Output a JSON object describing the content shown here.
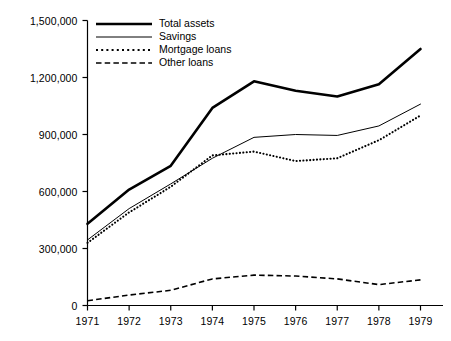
{
  "chart_data": {
    "type": "line",
    "title": "",
    "xlabel": "",
    "ylabel": "",
    "grid": false,
    "legend_position": "top-left-inside",
    "x": [
      1971,
      1972,
      1973,
      1974,
      1975,
      1976,
      1977,
      1978,
      1979
    ],
    "xticklabels": [
      "1971",
      "1972",
      "1973",
      "1974",
      "1975",
      "1976",
      "1977",
      "1978",
      "1979"
    ],
    "xlim": [
      1971,
      1979
    ],
    "ylim": [
      0,
      1500000
    ],
    "yticks": [
      0,
      300000,
      600000,
      900000,
      1200000,
      1500000
    ],
    "yticklabels": [
      "0",
      "300,000",
      "600,000",
      "900,000",
      "1,200,000",
      "1,500,000"
    ],
    "series": [
      {
        "name": "Total assets",
        "style": "solid-thick",
        "color": "#000000",
        "values": [
          430000,
          610000,
          735000,
          1040000,
          1180000,
          1130000,
          1100000,
          1165000,
          1350000
        ]
      },
      {
        "name": "Savings",
        "style": "solid-thin",
        "color": "#000000",
        "values": [
          345000,
          510000,
          640000,
          775000,
          885000,
          900000,
          895000,
          945000,
          1060000
        ]
      },
      {
        "name": "Mortgage loans",
        "style": "dotted",
        "color": "#000000",
        "values": [
          330000,
          490000,
          625000,
          790000,
          810000,
          760000,
          775000,
          870000,
          1000000
        ]
      },
      {
        "name": "Other loans",
        "style": "dashed",
        "color": "#000000",
        "values": [
          25000,
          55000,
          80000,
          140000,
          160000,
          155000,
          140000,
          110000,
          135000
        ]
      }
    ]
  },
  "legend": {
    "items": [
      {
        "label": "Total assets",
        "style": "solid-thick"
      },
      {
        "label": "Savings",
        "style": "solid-thin"
      },
      {
        "label": "Mortgage loans",
        "style": "dotted"
      },
      {
        "label": "Other loans",
        "style": "dashed"
      }
    ]
  },
  "axes": {
    "axis_color": "#000000"
  }
}
